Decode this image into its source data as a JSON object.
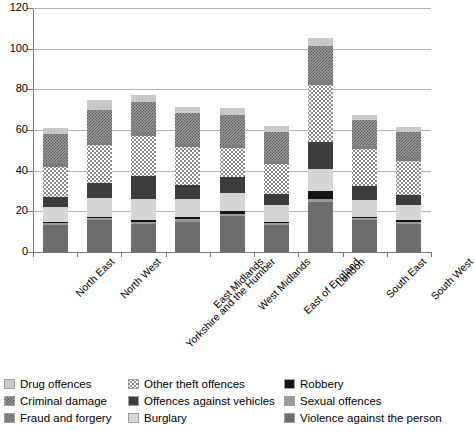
{
  "chart_data": {
    "type": "bar",
    "subtype": "stacked-bar",
    "title": "",
    "xlabel": "",
    "ylabel": "",
    "ylim": [
      0,
      120
    ],
    "yticks": [
      0,
      20,
      40,
      60,
      80,
      100,
      120
    ],
    "ytick_labels": [
      "0",
      "20",
      "40",
      "60",
      "80",
      "100",
      "120"
    ],
    "grid": true,
    "legend_position": "bottom",
    "categories": [
      "North East",
      "North West",
      "Yorkshire and the Humber",
      "East Midlands",
      "West Midlands",
      "East of England",
      "London",
      "South East",
      "South West"
    ],
    "series": [
      {
        "name": "Violence against the person",
        "color": "#6d6d6d",
        "pattern": "solid-dark-gray",
        "values": [
          13.5,
          15.5,
          14.0,
          15.0,
          17.5,
          13.5,
          24.5,
          15.5,
          14.0
        ]
      },
      {
        "name": "Sexual offences",
        "color": "#9a9a9a",
        "pattern": "solid-gray",
        "values": [
          1.0,
          1.0,
          1.0,
          1.0,
          1.0,
          1.0,
          1.5,
          1.0,
          1.0
        ]
      },
      {
        "name": "Robbery",
        "color": "#141414",
        "pattern": "solid-black",
        "values": [
          0.5,
          0.5,
          0.5,
          1.0,
          1.5,
          0.5,
          4.0,
          0.5,
          0.5
        ]
      },
      {
        "name": "Burglary",
        "color": "#d6d6d6",
        "pattern": "solid-light-gray",
        "values": [
          7.0,
          9.5,
          10.5,
          9.0,
          9.0,
          8.0,
          11.0,
          8.5,
          7.5
        ]
      },
      {
        "name": "Offences against vehicles",
        "color": "#3d3d3d",
        "pattern": "solid-very-dark",
        "values": [
          5.0,
          7.5,
          11.5,
          7.0,
          8.0,
          5.5,
          13.0,
          7.0,
          5.0
        ]
      },
      {
        "name": "Other theft offences",
        "color": "#ffffff",
        "pattern": "dotted",
        "values": [
          15.0,
          18.5,
          19.5,
          18.5,
          14.0,
          15.0,
          28.0,
          18.0,
          17.0
        ]
      },
      {
        "name": "Fraud and forgery",
        "color": "#7e7e7e",
        "pattern": "solid-mid-gray",
        "values": [
          1.5,
          1.5,
          1.5,
          1.5,
          1.5,
          1.5,
          2.5,
          1.5,
          1.5
        ]
      },
      {
        "name": "Criminal damage",
        "color": "#9c9c9c",
        "pattern": "checkered",
        "values": [
          14.5,
          16.0,
          15.5,
          15.5,
          15.0,
          14.0,
          17.0,
          13.0,
          12.5
        ]
      },
      {
        "name": "Drug offences",
        "color": "#c9c9c9",
        "pattern": "solid-light",
        "values": [
          3.0,
          5.0,
          3.0,
          3.0,
          3.5,
          3.0,
          4.0,
          2.5,
          2.5
        ]
      }
    ],
    "totals": [
      61.0,
      75.0,
      77.0,
      71.5,
      71.0,
      62.0,
      105.5,
      67.5,
      61.5
    ]
  },
  "legend": {
    "columns": [
      {
        "items": [
          {
            "label": "Drug offences",
            "swatch": "drug-offences-swatch"
          },
          {
            "label": "Criminal damage",
            "swatch": "criminal-damage-swatch"
          },
          {
            "label": "Fraud and forgery",
            "swatch": "fraud-and-forgery-swatch"
          }
        ]
      },
      {
        "items": [
          {
            "label": "Other theft offences",
            "swatch": "other-theft-offences-swatch"
          },
          {
            "label": "Offences against vehicles",
            "swatch": "offences-against-vehicles-swatch"
          },
          {
            "label": "Burglary",
            "swatch": "burglary-swatch"
          }
        ]
      },
      {
        "items": [
          {
            "label": "Robbery",
            "swatch": "robbery-swatch"
          },
          {
            "label": "Sexual offences",
            "swatch": "sexual-offences-swatch"
          },
          {
            "label": "Violence against the person",
            "swatch": "violence-against-the-person-swatch"
          }
        ]
      }
    ]
  }
}
